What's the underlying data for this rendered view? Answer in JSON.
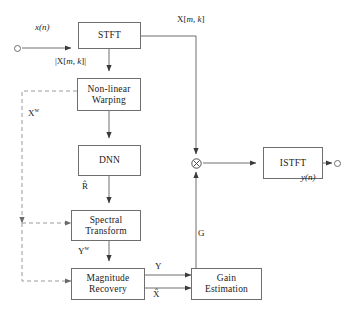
{
  "diagram": {
    "type": "block-diagram",
    "colors": {
      "stroke": "#6f6f6f",
      "text": "#1a1a1a",
      "background": "#ffffff",
      "dashed_stroke": "#9a9a9a"
    },
    "blocks": [
      {
        "id": "stft",
        "label": "STFT",
        "line1": "STFT",
        "line2": ""
      },
      {
        "id": "warping",
        "label": "Non-linear Warping",
        "line1": "Non-linear",
        "line2": "Warping"
      },
      {
        "id": "dnn",
        "label": "DNN",
        "line1": "DNN",
        "line2": ""
      },
      {
        "id": "spectral",
        "label": "Spectral Transform",
        "line1": "Spectral",
        "line2": "Transform"
      },
      {
        "id": "magnitude",
        "label": "Magnitude Recovery",
        "line1": "Magnitude",
        "line2": "Recovery"
      },
      {
        "id": "gain",
        "label": "Gain Estimation",
        "line1": "Gain",
        "line2": "Estimation"
      },
      {
        "id": "istft",
        "label": "ISTFT",
        "line1": "ISTFT",
        "line2": ""
      }
    ],
    "signals": {
      "input": "x(n)",
      "stft_output": "X[m, k]",
      "stft_magnitude": "|X[m, k]|",
      "warped_input": "Xw",
      "dnn_output": "R",
      "warped_output": "Yw",
      "recovered_magnitude": "Y",
      "estimated_spectrum": "X",
      "gain": "G",
      "output": "y(n)"
    },
    "operators": {
      "multiply": "multiply-node"
    },
    "terminals": {
      "input_terminal": "input-terminal",
      "output_terminal": "output-terminal"
    }
  }
}
